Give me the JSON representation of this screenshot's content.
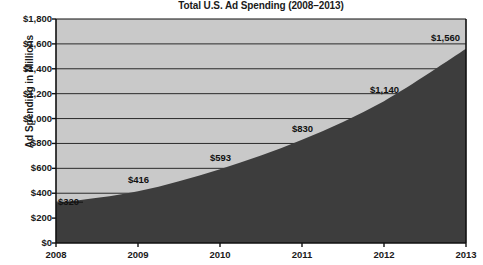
{
  "chart_data": {
    "type": "area",
    "title": "Total U.S. Ad Spending (2008–2013)",
    "xlabel": "",
    "ylabel": "Ad Spending in Millions",
    "categories": [
      "2008",
      "2009",
      "2010",
      "2011",
      "2012",
      "2013"
    ],
    "x": [
      2008,
      2009,
      2010,
      2011,
      2012,
      2013
    ],
    "values": [
      320,
      416,
      593,
      830,
      1140,
      1560
    ],
    "point_labels": [
      "$320",
      "$416",
      "$593",
      "$830",
      "$1,140",
      "$1,560"
    ],
    "ylim": [
      0,
      1800
    ],
    "y_ticks": [
      0,
      200,
      400,
      600,
      800,
      1000,
      1200,
      1400,
      1600,
      1800
    ],
    "y_tick_labels": [
      "$0",
      "$200",
      "$400",
      "$600",
      "$800",
      "$1,000",
      "$1,200",
      "$1,400",
      "$1,600",
      "$1,800"
    ],
    "xlim": [
      2008,
      2013
    ],
    "grid": "horizontal",
    "legend": "none",
    "colors": {
      "area_fill": "#3d3d3d",
      "plot_background": "#c9c9c9",
      "gridline": "#2a2a2a",
      "axis": "#111111",
      "text": "#1a1a1a",
      "page_background": "#ffffff"
    }
  },
  "axis": {
    "y_title": "Ad Spending in Millions"
  }
}
